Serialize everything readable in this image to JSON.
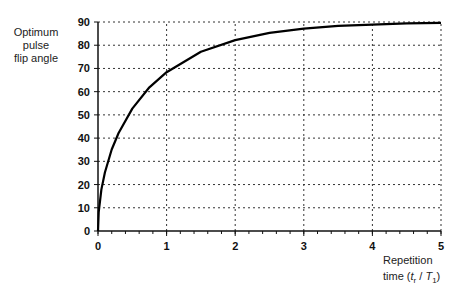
{
  "chart_data": {
    "type": "line",
    "title": "",
    "ylabel": "Optimum pulse flip angle",
    "xlabel": "Repetition time (t_r/T_1)",
    "xlim": [
      0,
      5
    ],
    "ylim": [
      0,
      90
    ],
    "xticks": [
      "0",
      "1",
      "2",
      "3",
      "4",
      "5"
    ],
    "yticks": [
      "0",
      "10",
      "20",
      "30",
      "40",
      "50",
      "60",
      "70",
      "80",
      "90"
    ],
    "grid": true,
    "legend": null,
    "series": [
      {
        "name": "Optimum flip angle",
        "x": [
          0,
          0.01,
          0.05,
          0.1,
          0.2,
          0.3,
          0.5,
          0.75,
          1,
          1.5,
          2,
          2.5,
          3,
          3.5,
          4,
          4.5,
          5
        ],
        "y": [
          0,
          8.1,
          17.9,
          25.2,
          35.1,
          42.2,
          52.7,
          61.9,
          68.4,
          77.2,
          82.2,
          85.3,
          87.1,
          88.3,
          88.9,
          89.4,
          89.6
        ]
      }
    ]
  },
  "labels": {
    "y_line1": "Optimum",
    "y_line2": "pulse",
    "y_line3": "flip angle",
    "x_line1": "Repetition",
    "x_line2_prefix": "time (",
    "x_var_t": "t",
    "x_sub_r": "r",
    "x_slash": " / ",
    "x_var_T": "T",
    "x_sub_1": "1",
    "x_suffix": ")"
  }
}
